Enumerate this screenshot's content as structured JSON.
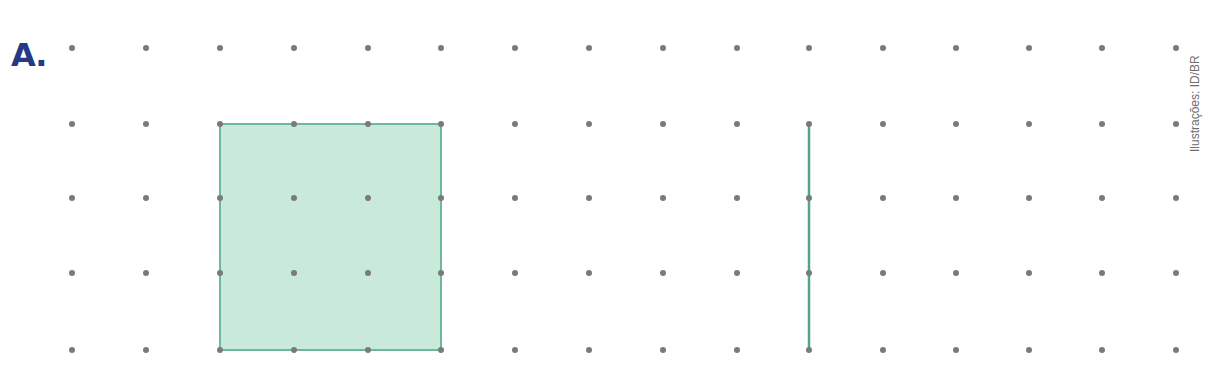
{
  "figure": {
    "label": "A.",
    "credit": "Ilustrações: ID/BR"
  },
  "grid": {
    "columns_x": [
      72,
      146,
      220,
      294,
      368,
      441,
      515,
      589,
      663,
      737,
      809,
      883,
      956,
      1029,
      1102,
      1176
    ],
    "rows_y": [
      48,
      124,
      198,
      273,
      350
    ],
    "dot_color": "#7a7a7a",
    "dot_radius": 3
  },
  "shapes": {
    "square": {
      "col_start": 2,
      "col_end": 5,
      "row_start": 1,
      "row_end": 4,
      "fill": "#c9eadb",
      "stroke": "#6cb89a"
    },
    "segment": {
      "col": 10,
      "row_start": 1,
      "row_end": 4,
      "stroke": "#4fa68a"
    }
  }
}
